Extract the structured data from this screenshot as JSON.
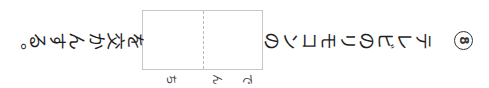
{
  "question": {
    "number": "8",
    "text_before_blank": "テレビのリモコンの",
    "text_after_blank": "を交かんする。",
    "answer_box": {
      "cells": [
        {
          "reading": "でん"
        },
        {
          "reading": "ち"
        }
      ]
    }
  },
  "colors": {
    "text": "#1e1e1e",
    "box_border": "#c8c8c8",
    "cell_divider": "#b9b9b9",
    "background": "#ffffff"
  }
}
